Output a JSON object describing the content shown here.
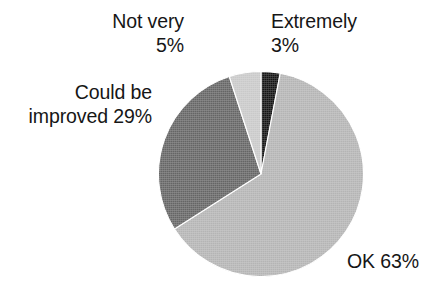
{
  "background": "#ffffff",
  "text_color": "#161616",
  "chart_data": {
    "type": "pie",
    "title": "",
    "subtitle": "",
    "xlabel": "",
    "ylabel": "",
    "legend": "none",
    "grid": false,
    "start_angle_deg": 0,
    "direction": "clockwise",
    "units": "percent",
    "total": 100,
    "categories": [
      "Extremely",
      "OK",
      "Could be improved",
      "Not very"
    ],
    "values": [
      3,
      63,
      29,
      5
    ],
    "colors": [
      "#131313",
      "#b4b4b4",
      "#656565",
      "#c9c9c9"
    ],
    "slices": [
      {
        "name": "Extremely",
        "value": 3,
        "value_label": "3%",
        "color": "#131313",
        "start_deg": 0.0,
        "end_deg": 10.8
      },
      {
        "name": "OK",
        "value": 63,
        "value_label": "63%",
        "color": "#b4b4b4",
        "start_deg": 10.8,
        "end_deg": 237.6
      },
      {
        "name": "Could be improved",
        "value": 29,
        "value_label": "29%",
        "color": "#656565",
        "start_deg": 237.6,
        "end_deg": 342.0
      },
      {
        "name": "Not very",
        "value": 5,
        "value_label": "5%",
        "color": "#c9c9c9",
        "start_deg": 342.0,
        "end_deg": 360.0
      }
    ]
  },
  "labels": {
    "not_very": "Not very\n5%",
    "extremely": "Extremely\n3%",
    "could_be_improved": "Could be\nimproved 29%",
    "ok": "OK 63%"
  }
}
